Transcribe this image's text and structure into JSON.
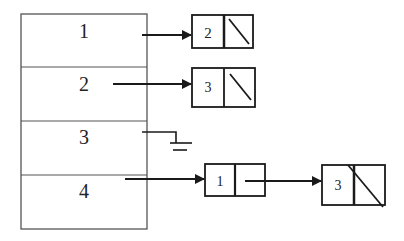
{
  "diagram": {
    "type": "adjacency-list",
    "colors": {
      "stroke": "#1a1a1a",
      "table_stroke": "#555555",
      "background": "#ffffff"
    },
    "vertex_table": {
      "rows": [
        {
          "label": "1",
          "pointer": "list"
        },
        {
          "label": "2",
          "pointer": "list"
        },
        {
          "label": "3",
          "pointer": "null (ground)"
        },
        {
          "label": "4",
          "pointer": "list"
        }
      ]
    },
    "lists": [
      {
        "row": "1",
        "nodes": [
          {
            "value": "2",
            "next": "null"
          }
        ]
      },
      {
        "row": "2",
        "nodes": [
          {
            "value": "3",
            "next": "null"
          }
        ]
      },
      {
        "row": "3",
        "nodes": []
      },
      {
        "row": "4",
        "nodes": [
          {
            "value": "1",
            "next": "node"
          },
          {
            "value": "3",
            "next": "null"
          }
        ]
      }
    ]
  }
}
